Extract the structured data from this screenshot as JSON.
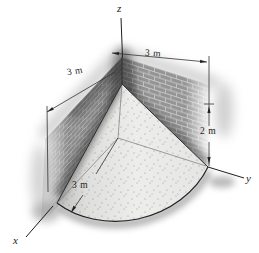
{
  "figure": {
    "type": "statics-diagram-quarter-cone-sand-pile",
    "axes": {
      "x_label": "x",
      "y_label": "y",
      "z_label": "z"
    },
    "dimensions": {
      "right_wall_length_label": "3 m",
      "left_wall_length_label": "3 m",
      "height_label": "2 m",
      "radius_label": "3 m"
    },
    "colors": {
      "background": "#ffffff",
      "brick": "#949494",
      "mortar": "#c8c8c8",
      "sand": "#e9e9e7",
      "line": "#2b2b2b",
      "shadow": "#555555"
    }
  }
}
